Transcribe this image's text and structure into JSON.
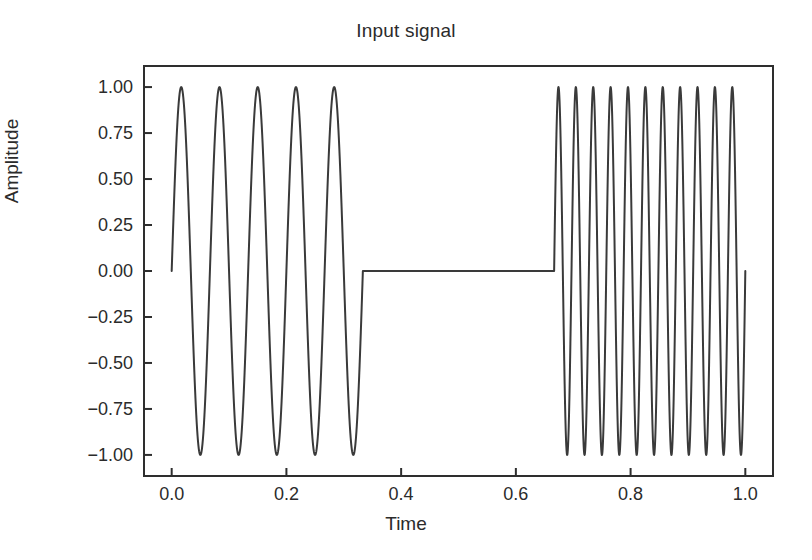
{
  "chart_data": {
    "type": "line",
    "title": "Input signal",
    "xlabel": "Time",
    "ylabel": "Amplitude",
    "xlim": [
      -0.05,
      1.05
    ],
    "ylim": [
      -1.12,
      1.12
    ],
    "grid": false,
    "legend": null,
    "line_color": "#3a3a3a",
    "line_width": 2,
    "background": "#ffffff",
    "xticks": [
      0.0,
      0.2,
      0.4,
      0.6,
      0.8,
      1.0
    ],
    "xtick_labels": [
      "0.0",
      "0.2",
      "0.4",
      "0.6",
      "0.8",
      "1.0"
    ],
    "yticks": [
      1.0,
      0.75,
      0.5,
      0.25,
      0.0,
      -0.25,
      -0.5,
      -0.75,
      -1.0
    ],
    "ytick_labels": [
      "1.00",
      "0.75",
      "0.50",
      "0.25",
      "0.00",
      "−0.25",
      "−0.50",
      "−0.75",
      "−1.00"
    ],
    "series": [
      {
        "name": "input signal",
        "description": "Three-segment signal: low-frequency sine burst, silence, high-frequency sine burst",
        "segments": [
          {
            "name": "low-frequency-burst",
            "x_start": 0.0,
            "x_end": 0.3333,
            "waveform": "sine",
            "amplitude": 1.0,
            "cycles": 5,
            "frequency_hz": 15,
            "phase": 0
          },
          {
            "name": "silence",
            "x_start": 0.3333,
            "x_end": 0.6667,
            "waveform": "constant",
            "amplitude": 0.0,
            "cycles": 0,
            "frequency_hz": 0,
            "phase": 0
          },
          {
            "name": "high-frequency-burst",
            "x_start": 0.6667,
            "x_end": 1.0,
            "waveform": "sine",
            "amplitude": 1.0,
            "cycles": 11,
            "frequency_hz": 33,
            "phase": 0
          }
        ],
        "key_points": [
          {
            "x": 0.0,
            "y": 0.0
          },
          {
            "x": 0.0167,
            "y": 1.0
          },
          {
            "x": 0.05,
            "y": -1.0
          },
          {
            "x": 0.0833,
            "y": 1.0
          },
          {
            "x": 0.1167,
            "y": -1.0
          },
          {
            "x": 0.15,
            "y": 1.0
          },
          {
            "x": 0.1833,
            "y": -1.0
          },
          {
            "x": 0.2167,
            "y": 1.0
          },
          {
            "x": 0.25,
            "y": -1.0
          },
          {
            "x": 0.2833,
            "y": 1.0
          },
          {
            "x": 0.3167,
            "y": -1.0
          },
          {
            "x": 0.3333,
            "y": 0.0
          },
          {
            "x": 0.6667,
            "y": 0.0
          },
          {
            "x": 0.6818,
            "y": 1.0
          },
          {
            "x": 0.697,
            "y": -1.0
          },
          {
            "x": 0.7121,
            "y": 1.0
          },
          {
            "x": 0.7273,
            "y": -1.0
          },
          {
            "x": 0.7424,
            "y": 1.0
          },
          {
            "x": 0.7576,
            "y": -1.0
          },
          {
            "x": 0.7727,
            "y": 1.0
          },
          {
            "x": 0.7879,
            "y": -1.0
          },
          {
            "x": 0.803,
            "y": 1.0
          },
          {
            "x": 0.8182,
            "y": -1.0
          },
          {
            "x": 0.8333,
            "y": 1.0
          },
          {
            "x": 0.8485,
            "y": -1.0
          },
          {
            "x": 0.8636,
            "y": 1.0
          },
          {
            "x": 0.8788,
            "y": -1.0
          },
          {
            "x": 0.8939,
            "y": 1.0
          },
          {
            "x": 0.9091,
            "y": -1.0
          },
          {
            "x": 0.9242,
            "y": 1.0
          },
          {
            "x": 0.9394,
            "y": -1.0
          },
          {
            "x": 0.9545,
            "y": 1.0
          },
          {
            "x": 0.9697,
            "y": -1.0
          },
          {
            "x": 0.9848,
            "y": 1.0
          },
          {
            "x": 1.0,
            "y": 0.0
          }
        ]
      }
    ]
  }
}
